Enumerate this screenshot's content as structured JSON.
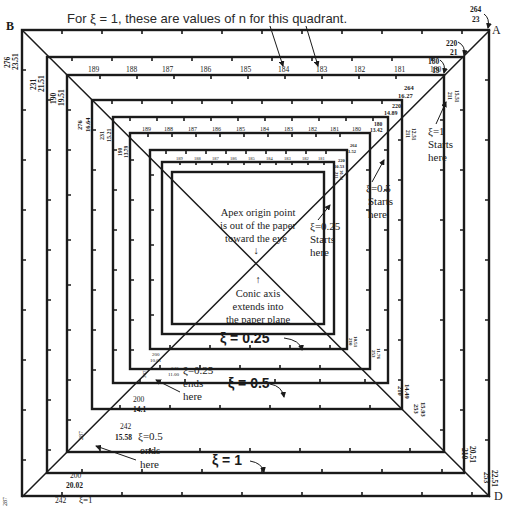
{
  "title": "For ξ = 1, these are values of n for this quadrant.",
  "corners": {
    "A": "A",
    "B": "B",
    "D": "D"
  },
  "top_n_values_outer": [
    "189",
    "188",
    "187",
    "186",
    "185",
    "184",
    "183",
    "182",
    "181",
    "180"
  ],
  "top_n_values_inner": [
    "189",
    "188",
    "187",
    "186",
    "185",
    "184",
    "183",
    "182",
    "181",
    "180"
  ],
  "corner_labels": {
    "A_outer": {
      "n": "264",
      "r": "23"
    },
    "A_2": {
      "n": "220",
      "r": "21"
    },
    "A_3": {
      "n": "180",
      "r": "19"
    },
    "A_4": {
      "n": "264",
      "r": "16.27"
    },
    "A_5": {
      "n": "220",
      "r": "14.89"
    },
    "A_6": {
      "n": "180",
      "r": "13.42"
    },
    "A_7": {
      "n": "264",
      "r": "11.52"
    },
    "A_8": {
      "n": "220",
      "r": "10.53"
    },
    "A_9": {
      "n": "180",
      "r": "9.49"
    },
    "B_outer": {
      "n": "276",
      "r": "23.51"
    },
    "B_2": {
      "n": "231",
      "r": "21.51"
    },
    "B_3": {
      "n": "190",
      "r": "19.51"
    },
    "B_4": {
      "n": "276",
      "r": "16.64"
    },
    "B_5": {
      "n": "231",
      "r": "15.21"
    },
    "B_6": {
      "n": "190",
      "r": "13.79"
    },
    "C_inner1": {
      "n": "200",
      "r": "10.01"
    },
    "C_inner2": {
      "n": "242",
      "r": "11.00"
    },
    "C_mid1": {
      "n": "200",
      "r": "14.1"
    },
    "C_mid2": {
      "n": "242",
      "r": "15.58"
    },
    "C_outer1": {
      "n": "200",
      "r": "20.02"
    },
    "C_outer2": {
      "n": "242",
      "r": "ξ=1"
    },
    "C_side_287_a": "287",
    "C_side_287_b": "287",
    "C_side_287_c": "287",
    "D_inner1": {
      "n": "210",
      "r": "10.51"
    },
    "D_inner2": {
      "n": "253",
      "r": "11.76"
    },
    "D_mid1": {
      "n": "210",
      "r": "14.49"
    },
    "D_mid2": {
      "n": "253",
      "r": "15.93"
    },
    "D_outer1": {
      "n": "210",
      "r": "20.51"
    },
    "D_outer2": {
      "n": "253",
      "r": "22.51"
    }
  },
  "annotations": {
    "xi1_starts": [
      "ξ=1",
      "Starts",
      "here"
    ],
    "xi05_starts": [
      "ξ=0.5",
      "Starts",
      "here"
    ],
    "xi025_starts": [
      "ξ=0.25",
      "Starts",
      "here"
    ],
    "apex": [
      "Apex origin point",
      "is out of the paper",
      "toward the eye"
    ],
    "apex_arrow": "↓",
    "conic": [
      "Conic axis",
      "extends into",
      "the paper plane"
    ],
    "conic_arrow": "↑",
    "xi025_label": "ξ = 0.25",
    "xi05_label": "ξ = 0.5",
    "xi1_label": "ξ = 1",
    "xi025_ends": [
      "ξ=0.25",
      "ends",
      "here"
    ],
    "xi05_ends": [
      "ξ=0.5",
      "ends",
      "here"
    ]
  }
}
